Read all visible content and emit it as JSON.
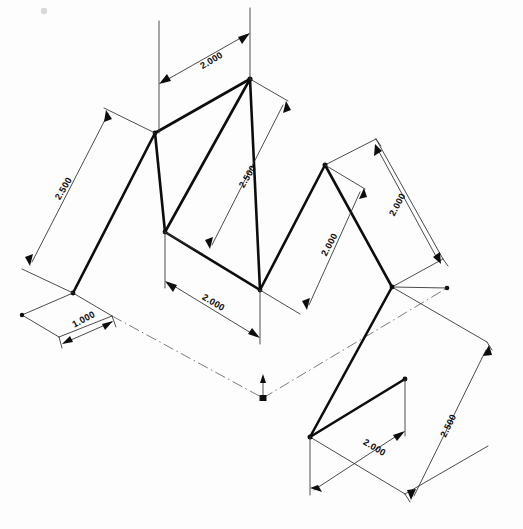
{
  "drawing": {
    "title": "Isometric Zig-Zag Sheet Metal Part",
    "type": "isometric-technical-drawing",
    "units_implied": "inches",
    "background_color": "#fdfdfd",
    "line_color": "#0d0d0d",
    "dimension_line_color": "#2b2b2b",
    "center_line_color": "#6e6e6e",
    "dimensions": [
      {
        "id": "dim-top-width",
        "label": "2.000",
        "x": 213,
        "y": 63,
        "rotation": -31,
        "region": "top-ridge-width"
      },
      {
        "id": "dim-left-slope",
        "label": "2.500",
        "x": 66,
        "y": 190,
        "rotation": -59,
        "region": "left-panel-slope"
      },
      {
        "id": "dim-bottom-left-foot",
        "label": "1.000",
        "x": 85,
        "y": 322,
        "rotation": -31,
        "region": "left-foot-width"
      },
      {
        "id": "dim-center-slope",
        "label": "2.500",
        "x": 248,
        "y": 180,
        "rotation": -59,
        "region": "center-panel-slope"
      },
      {
        "id": "dim-center-base",
        "label": "2.000",
        "x": 213,
        "y": 305,
        "rotation": 31,
        "region": "center-base-width"
      },
      {
        "id": "dim-right-inner",
        "label": "2.000",
        "x": 330,
        "y": 230,
        "rotation": -59,
        "region": "right-inner-slope"
      },
      {
        "id": "dim-right-outer",
        "label": "2.000",
        "x": 400,
        "y": 206,
        "rotation": -59,
        "region": "right-outer-slope"
      },
      {
        "id": "dim-bottom-right-tab",
        "label": "2.000",
        "x": 375,
        "y": 451,
        "rotation": 31,
        "region": "bottom-tab-width"
      },
      {
        "id": "dim-right-long-slope",
        "label": "2.500",
        "x": 450,
        "y": 429,
        "rotation": -59,
        "region": "right-long-slope"
      }
    ],
    "vertices": [
      {
        "id": "v-left-foot-outer",
        "x": 22,
        "y": 315
      },
      {
        "id": "v-left-foot-inner",
        "x": 73,
        "y": 293
      },
      {
        "id": "v-left-ridge",
        "x": 155,
        "y": 133
      },
      {
        "id": "v-top-apex",
        "x": 250,
        "y": 79
      },
      {
        "id": "v-mid-left-base",
        "x": 165,
        "y": 232
      },
      {
        "id": "v-mid-right-base",
        "x": 260,
        "y": 290
      },
      {
        "id": "v-right-apex",
        "x": 325,
        "y": 165
      },
      {
        "id": "v-right-base",
        "x": 392,
        "y": 287
      },
      {
        "id": "v-tab-left",
        "x": 310,
        "y": 437
      },
      {
        "id": "v-tab-right-top",
        "x": 405,
        "y": 379
      },
      {
        "id": "v-centerline-end",
        "x": 447,
        "y": 288
      }
    ],
    "origin_marker": {
      "id": "origin-symbol",
      "x": 263,
      "y": 398,
      "description": "coordinate origin arrow with square marker at centerline intersection"
    },
    "notes": {
      "projection": "isometric",
      "visible_annotations_count": 9
    }
  }
}
